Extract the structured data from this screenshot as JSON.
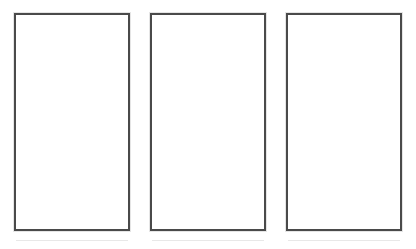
{
  "page": {
    "background_color": "#ffffff"
  },
  "style": {
    "border_color": "#4a4a4a",
    "panel_fill": "#ffffff",
    "ghost_color": "#fbfbfb",
    "artifact_color": "#cdcdcd"
  },
  "panels": [
    {
      "id": "panel-1",
      "label": "",
      "content": "",
      "ghost_text": "",
      "x": 14,
      "y": 13,
      "width": 116,
      "height": 218
    },
    {
      "id": "panel-2",
      "label": "",
      "content": "",
      "ghost_text": "",
      "x": 150,
      "y": 13,
      "width": 116,
      "height": 218
    },
    {
      "id": "panel-3",
      "label": "",
      "content": "",
      "ghost_text": "",
      "x": 286,
      "y": 13,
      "width": 116,
      "height": 218
    }
  ]
}
